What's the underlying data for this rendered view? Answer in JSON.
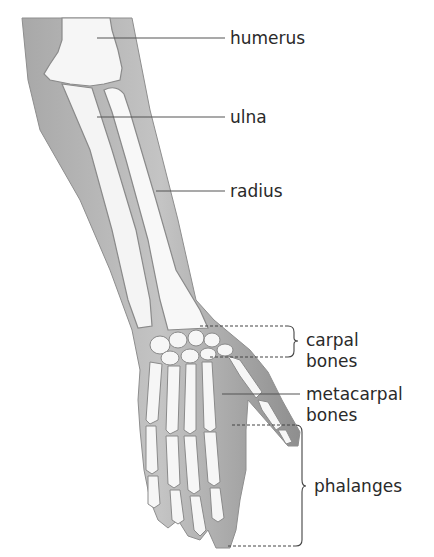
{
  "figure": {
    "colors": {
      "skin": "#9a9a9a",
      "skin_light": "#b8b8b8",
      "bone": "#f6f6f6",
      "bone_outline": "#8a8a8a",
      "leader": "#555555",
      "text": "#2a2a2a"
    }
  },
  "labels": [
    {
      "id": "humerus",
      "text": "humerus"
    },
    {
      "id": "ulna",
      "text": "ulna"
    },
    {
      "id": "radius",
      "text": "radius"
    },
    {
      "id": "carpal",
      "line1": "carpal",
      "line2": "bones"
    },
    {
      "id": "metacarpal",
      "line1": "metacarpal",
      "line2": "bones"
    },
    {
      "id": "phalanges",
      "text": "phalanges"
    }
  ]
}
